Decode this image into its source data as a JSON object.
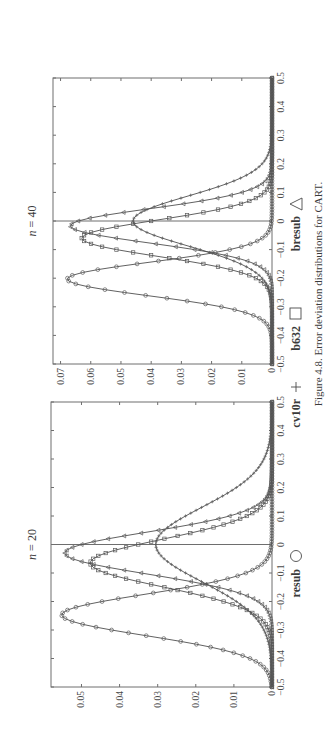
{
  "figure": {
    "caption": "Figure 4.8.  Error deviation distributions for CART.",
    "legend": [
      {
        "label": "resub",
        "marker": "circle"
      },
      {
        "label": "cv10r",
        "marker": "plus"
      },
      {
        "label": "b632",
        "marker": "square"
      },
      {
        "label": "bresub",
        "marker": "triangle"
      }
    ]
  },
  "chart_data": [
    {
      "type": "line",
      "title": "n = 20",
      "xlabel": "",
      "ylabel": "",
      "xlim": [
        -0.5,
        0.5
      ],
      "ylim": [
        0,
        0.058
      ],
      "x_ticks": [
        "-0.5",
        "-0.4",
        "-0.3",
        "-0.2",
        "-0.1",
        "0",
        "0.1",
        "0.2",
        "0.3",
        "0.4",
        "0.5"
      ],
      "y_ticks": [
        "0",
        "0.01",
        "0.02",
        "0.03",
        "0.04",
        "0.05"
      ],
      "grid": false,
      "vertical_line_at_x": 0,
      "sampling": {
        "x_start": -0.5,
        "x_end": 0.5,
        "step": 0.01
      },
      "series": [
        {
          "name": "resub",
          "marker": "circle",
          "shape": "gaussian",
          "peak_x": -0.247,
          "peak_y": 0.0552,
          "sigma": 0.072
        },
        {
          "name": "cv10r",
          "marker": "plus",
          "shape": "gaussian",
          "peak_x": 0.0,
          "peak_y": 0.0305,
          "sigma": 0.13
        },
        {
          "name": "b632",
          "marker": "square",
          "shape": "gaussian",
          "peak_x": -0.065,
          "peak_y": 0.0477,
          "sigma": 0.083
        },
        {
          "name": "bresub",
          "marker": "triangle",
          "shape": "gaussian",
          "peak_x": -0.03,
          "peak_y": 0.0544,
          "sigma": 0.073
        }
      ]
    },
    {
      "type": "line",
      "title": "n = 40",
      "xlabel": "",
      "ylabel": "",
      "xlim": [
        -0.5,
        0.5
      ],
      "ylim": [
        0,
        0.0725
      ],
      "x_ticks": [
        "-0.5",
        "-0.4",
        "-0.3",
        "-0.2",
        "-0.1",
        "0",
        "0.1",
        "0.2",
        "0.3",
        "0.4",
        "0.5"
      ],
      "y_ticks": [
        "0",
        "0.01",
        "0.02",
        "0.03",
        "0.04",
        "0.05",
        "0.06",
        "0.07"
      ],
      "grid": false,
      "vertical_line_at_x": 0,
      "sampling": {
        "x_start": -0.5,
        "x_end": 0.5,
        "step": 0.01
      },
      "series": [
        {
          "name": "resub",
          "marker": "circle",
          "shape": "gaussian",
          "peak_x": -0.203,
          "peak_y": 0.0678,
          "sigma": 0.058
        },
        {
          "name": "cv10r",
          "marker": "plus",
          "shape": "gaussian",
          "peak_x": 0.0,
          "peak_y": 0.046,
          "sigma": 0.087
        },
        {
          "name": "b632",
          "marker": "square",
          "shape": "gaussian",
          "peak_x": -0.06,
          "peak_y": 0.063,
          "sigma": 0.063
        },
        {
          "name": "bresub",
          "marker": "triangle",
          "shape": "gaussian",
          "peak_x": -0.017,
          "peak_y": 0.0668,
          "sigma": 0.06
        }
      ]
    }
  ]
}
